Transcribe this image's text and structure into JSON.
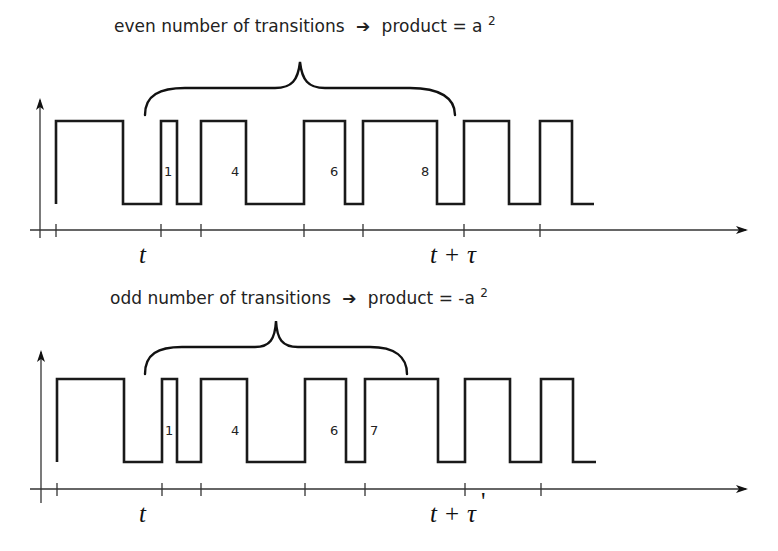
{
  "panels": [
    {
      "id": "even",
      "caption_prefix": "even number of transitions",
      "arrow_glyph": "➔",
      "caption_suffix": "product = a",
      "superscript": "2",
      "transition_labels": [
        "1",
        "4",
        "6",
        "8"
      ],
      "tick_label_left": "t",
      "tick_label_right_t": "t",
      "tick_label_right_plus": "+",
      "tick_label_right_tau": "τ",
      "tick_label_right_prime": ""
    },
    {
      "id": "odd",
      "caption_prefix": "odd number of transitions",
      "arrow_glyph": "➔",
      "caption_suffix": "product = -a",
      "superscript": "2",
      "transition_labels": [
        "1",
        "4",
        "6",
        "7"
      ],
      "tick_label_left": "t",
      "tick_label_right_t": "t",
      "tick_label_right_plus": "+",
      "tick_label_right_tau": "τ",
      "tick_label_right_prime": "'"
    }
  ],
  "waveform": {
    "edge_x": [
      56,
      123,
      161,
      177,
      201,
      246,
      304,
      345,
      363,
      437,
      464,
      509,
      540,
      572
    ],
    "end_x": 594,
    "tick_x": [
      56,
      161,
      201,
      304,
      363,
      464,
      540
    ]
  }
}
